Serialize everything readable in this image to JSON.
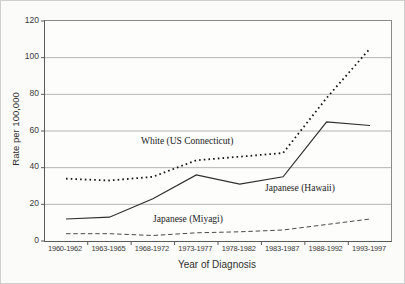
{
  "colors": {
    "background": "#fbfbf9",
    "plot_background": "#fdfdfc",
    "grid": "#b5b5b5",
    "axis": "#5a5a5a",
    "line_dotted": "#161616",
    "line_solid": "#2e2e2e",
    "line_dashed": "#4a4a4a"
  },
  "chart_data": {
    "type": "line",
    "title": "",
    "xlabel": "Year of Diagnosis",
    "ylabel": "Rate per 100,000",
    "ylim": [
      0,
      120
    ],
    "yticks": [
      0,
      20,
      40,
      60,
      80,
      100,
      120
    ],
    "grid": true,
    "legend_position": "inline-labels",
    "categories": [
      "1960-1962",
      "1963-1965",
      "1968-1972",
      "1973-1977",
      "1978-1982",
      "1983-1987",
      "1988-1992",
      "1993-1997"
    ],
    "series": [
      {
        "name": "White (US Connecticut)",
        "style": "dotted",
        "values": [
          34,
          33,
          35,
          44,
          46,
          48,
          78,
          105
        ]
      },
      {
        "name": "Japanese (Hawaii)",
        "style": "solid",
        "values": [
          12,
          13,
          23,
          36,
          31,
          35,
          65,
          63
        ]
      },
      {
        "name": "Japanese (Miyagi)",
        "style": "dashed",
        "values": [
          4,
          4,
          3,
          4.5,
          5,
          6,
          9,
          12
        ]
      }
    ]
  }
}
